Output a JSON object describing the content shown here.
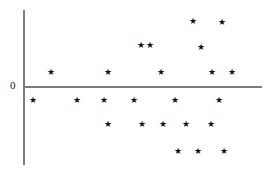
{
  "figure": {
    "width": 268,
    "height": 171,
    "background": "#ffffff",
    "marker_glyph": "★",
    "marker_color": "#111111",
    "axis_color": "#7d7d7d"
  },
  "axes": {
    "zero_label": "0",
    "zero_label_x": 10,
    "zero_label_y": 80,
    "vertical": {
      "x": 23,
      "y_top": 10,
      "y_bottom": 165,
      "thickness": 2
    },
    "horizontal": {
      "y": 86,
      "x_left": 23,
      "x_right": 262,
      "thickness": 2
    }
  },
  "chart_data": {
    "type": "scatter",
    "title": "",
    "xlabel": "",
    "ylabel": "",
    "tick_labels": {
      "y": [
        "0"
      ],
      "x": []
    },
    "grid": false,
    "legend": null,
    "marker": "star",
    "baseline_y": 0,
    "xlim": [
      23,
      262
    ],
    "ylim": [
      -85,
      76
    ],
    "note": "Residual-style scatter about a zero reference line; coordinates are pixel positions of star centers, y_value is signed pixel offset from the zero axis (positive above).",
    "points": [
      {
        "x": 193,
        "y": 21,
        "y_value": 65
      },
      {
        "x": 222,
        "y": 22,
        "y_value": 64
      },
      {
        "x": 141,
        "y": 45,
        "y_value": 41
      },
      {
        "x": 150,
        "y": 45,
        "y_value": 41
      },
      {
        "x": 201,
        "y": 47,
        "y_value": 39
      },
      {
        "x": 51,
        "y": 72,
        "y_value": 14
      },
      {
        "x": 108,
        "y": 72,
        "y_value": 14
      },
      {
        "x": 161,
        "y": 72,
        "y_value": 14
      },
      {
        "x": 212,
        "y": 72,
        "y_value": 14
      },
      {
        "x": 232,
        "y": 72,
        "y_value": 14
      },
      {
        "x": 33,
        "y": 100,
        "y_value": -14
      },
      {
        "x": 77,
        "y": 100,
        "y_value": -14
      },
      {
        "x": 104,
        "y": 100,
        "y_value": -14
      },
      {
        "x": 134,
        "y": 100,
        "y_value": -14
      },
      {
        "x": 175,
        "y": 100,
        "y_value": -14
      },
      {
        "x": 219,
        "y": 100,
        "y_value": -14
      },
      {
        "x": 108,
        "y": 124,
        "y_value": -38
      },
      {
        "x": 142,
        "y": 124,
        "y_value": -38
      },
      {
        "x": 163,
        "y": 124,
        "y_value": -38
      },
      {
        "x": 186,
        "y": 124,
        "y_value": -38
      },
      {
        "x": 211,
        "y": 124,
        "y_value": -38
      },
      {
        "x": 178,
        "y": 151,
        "y_value": -65
      },
      {
        "x": 198,
        "y": 151,
        "y_value": -65
      },
      {
        "x": 224,
        "y": 151,
        "y_value": -65
      }
    ]
  }
}
